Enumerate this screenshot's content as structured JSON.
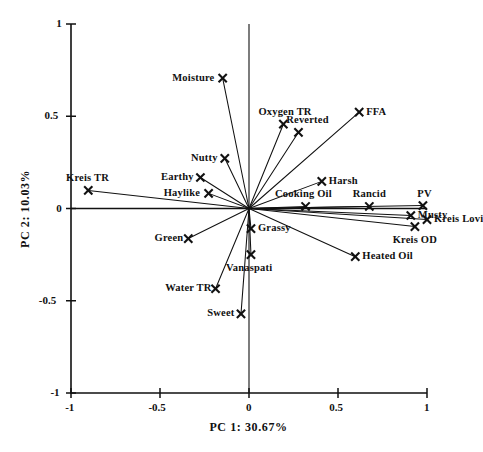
{
  "figure": {
    "kind": "pca-biplot",
    "background": "#ffffff",
    "ink_color": "#111111"
  },
  "chart_data": {
    "type": "scatter",
    "title": "",
    "subtitle": "",
    "xlabel": "PC 1: 30.67%",
    "ylabel": "PC 2: 10.03%",
    "xlim": [
      -1,
      1
    ],
    "ylim": [
      -1,
      1
    ],
    "xticks": [
      -1,
      -0.5,
      0,
      0.5,
      1
    ],
    "xtick_labels": [
      "-1",
      "-0.5",
      "0",
      "0.5",
      "1"
    ],
    "yticks": [
      1,
      0.5,
      0,
      -0.5,
      -1
    ],
    "ytick_labels": [
      "1",
      "0.5",
      "0",
      "-0.5",
      "-1"
    ],
    "grid": false,
    "legend": "none",
    "marker": "x",
    "annotations": [
      "vectors drawn from origin (0,0) to each loading point"
    ],
    "points": [
      {
        "label": "Moisture",
        "x": -0.148,
        "y": 0.707,
        "label_pos": "left"
      },
      {
        "label": "Oxygen TR",
        "x": 0.193,
        "y": 0.457,
        "label_pos": "above"
      },
      {
        "label": "Reverted",
        "x": 0.278,
        "y": 0.413,
        "label_pos": "above-right"
      },
      {
        "label": "FFA",
        "x": 0.619,
        "y": 0.522,
        "label_pos": "right"
      },
      {
        "label": "Nutty",
        "x": -0.136,
        "y": 0.272,
        "label_pos": "left"
      },
      {
        "label": "Earthy",
        "x": -0.273,
        "y": 0.168,
        "label_pos": "left"
      },
      {
        "label": "Kreis TR",
        "x": -0.903,
        "y": 0.098,
        "label_pos": "above"
      },
      {
        "label": "Haylike",
        "x": -0.227,
        "y": 0.082,
        "label_pos": "left"
      },
      {
        "label": "Harsh",
        "x": 0.409,
        "y": 0.147,
        "label_pos": "right"
      },
      {
        "label": "Cooking Oil",
        "x": 0.318,
        "y": 0.011,
        "label_pos": "above"
      },
      {
        "label": "Rancid",
        "x": 0.676,
        "y": 0.011,
        "label_pos": "above"
      },
      {
        "label": "PV",
        "x": 0.977,
        "y": 0.016,
        "label_pos": "above"
      },
      {
        "label": "Musty",
        "x": 0.909,
        "y": -0.038,
        "label_pos": "right"
      },
      {
        "label": "Kreis Lovi",
        "x": 1.0,
        "y": -0.06,
        "label_pos": "right"
      },
      {
        "label": "Grassy",
        "x": 0.011,
        "y": -0.109,
        "label_pos": "right"
      },
      {
        "label": "Kreis OD",
        "x": 0.932,
        "y": -0.098,
        "label_pos": "below"
      },
      {
        "label": "Green",
        "x": -0.341,
        "y": -0.163,
        "label_pos": "left"
      },
      {
        "label": "Vanaspati",
        "x": 0.011,
        "y": -0.25,
        "label_pos": "below"
      },
      {
        "label": "Heated Oil",
        "x": 0.597,
        "y": -0.261,
        "label_pos": "right"
      },
      {
        "label": "Water TR",
        "x": -0.188,
        "y": -0.435,
        "label_pos": "left"
      },
      {
        "label": "Sweet",
        "x": -0.045,
        "y": -0.571,
        "label_pos": "left"
      }
    ]
  }
}
